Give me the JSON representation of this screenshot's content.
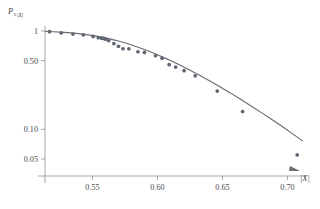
{
  "figure": {
    "caption": "",
    "background": "#ffffff",
    "point_color": "#5f6472",
    "curve_color": "#6b6b70",
    "axis_color": "#8f8f8f"
  },
  "labels": {
    "ylabel_main": "P",
    "ylabel_sub": ">|X|",
    "xlabel": "|X|"
  },
  "chart_data": {
    "type": "scatter",
    "title": "",
    "xlabel": "|X|",
    "ylabel": "P>|X|",
    "yscale": "log",
    "xscale": "linear",
    "grid": false,
    "legend": false,
    "xlim": [
      0.5135,
      0.7135
    ],
    "ylim": [
      0.042,
      1.12
    ],
    "xticks": [
      0.55,
      0.6,
      0.65,
      0.7
    ],
    "xticklabels": [
      "0.55",
      "0.60",
      "0.65",
      "0.70"
    ],
    "yticks": [
      1,
      0.5,
      0.1,
      0.05
    ],
    "yticklabels": [
      "1",
      "0.50",
      "0.10",
      "0.05"
    ],
    "series": [
      {
        "name": "data",
        "type": "scatter",
        "marker": "circle",
        "color": "#5f6472",
        "x": [
          0.517,
          0.526,
          0.535,
          0.543,
          0.5505,
          0.5545,
          0.557,
          0.5585,
          0.56,
          0.5625,
          0.5665,
          0.57,
          0.5735,
          0.578,
          0.585,
          0.59,
          0.5985,
          0.6035,
          0.609,
          0.614,
          0.6205,
          0.629,
          0.646,
          0.6655,
          0.7075
        ],
        "y": [
          0.985,
          0.955,
          0.93,
          0.915,
          0.88,
          0.855,
          0.845,
          0.84,
          0.825,
          0.8,
          0.745,
          0.7,
          0.66,
          0.66,
          0.615,
          0.605,
          0.56,
          0.53,
          0.455,
          0.43,
          0.395,
          0.35,
          0.245,
          0.152,
          0.055
        ]
      },
      {
        "name": "fit",
        "type": "line",
        "color": "#6b6b70",
        "x": [
          0.5135,
          0.52,
          0.528,
          0.536,
          0.544,
          0.552,
          0.56,
          0.568,
          0.576,
          0.584,
          0.592,
          0.6,
          0.608,
          0.616,
          0.624,
          0.632,
          0.64,
          0.648,
          0.656,
          0.664,
          0.672,
          0.68,
          0.688,
          0.696,
          0.704,
          0.712
        ],
        "y": [
          0.99,
          0.982,
          0.968,
          0.95,
          0.925,
          0.893,
          0.852,
          0.804,
          0.75,
          0.693,
          0.633,
          0.573,
          0.515,
          0.459,
          0.406,
          0.357,
          0.312,
          0.271,
          0.235,
          0.202,
          0.173,
          0.148,
          0.126,
          0.107,
          0.09,
          0.076
        ]
      }
    ]
  }
}
